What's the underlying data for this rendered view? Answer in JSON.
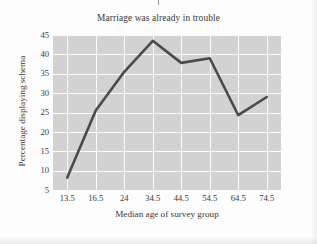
{
  "chart_data": {
    "type": "line",
    "title": "Marriage was already in trouble",
    "xlabel": "Median age of survey group",
    "ylabel": "Percentage displaying schema",
    "categories": [
      "13.5",
      "16.5",
      "24",
      "34.5",
      "44.5",
      "54.5",
      "64.5",
      "74.5"
    ],
    "x": [
      13.5,
      16.5,
      24,
      34.5,
      44.5,
      54.5,
      64.5,
      74.5
    ],
    "values": [
      8.2,
      25.5,
      35.5,
      43.5,
      37.8,
      39.0,
      24.3,
      29.0
    ],
    "yticks": [
      "5",
      "10",
      "15",
      "20",
      "25",
      "30",
      "35",
      "40",
      "45"
    ],
    "ylim": [
      5,
      45
    ],
    "grid": true,
    "legend": false,
    "series": [
      {
        "name": "Marriage was already in trouble",
        "values": [
          8.2,
          25.5,
          35.5,
          43.5,
          37.8,
          39.0,
          24.3,
          29.0
        ]
      }
    ],
    "colors": {
      "line": "#4a4a4a",
      "plot_background": "#d2d2d2",
      "gridline": "#fbfbfb",
      "text": "#3a3a3a",
      "page_background": "#fdfdfd"
    },
    "line_width": 2.6
  }
}
